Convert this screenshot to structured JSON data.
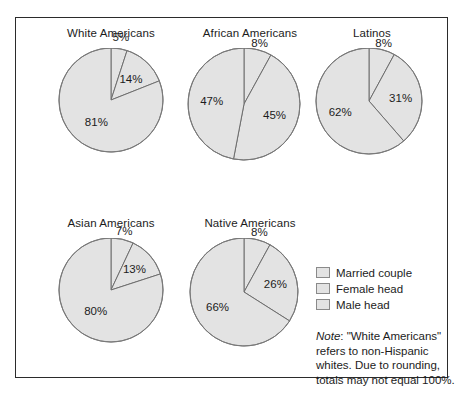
{
  "chart_data": {
    "type": "pie",
    "title": "",
    "legend_position": "right-middle",
    "legend": [
      "Married couple",
      "Female head",
      "Male head"
    ],
    "series_order": [
      "Male head",
      "Female head",
      "Married couple"
    ],
    "start_angle_deg": 0,
    "direction": "clockwise",
    "units": "percent",
    "charts": [
      {
        "title": "White Americans",
        "categories": [
          "Male head",
          "Female head",
          "Married couple"
        ],
        "values": [
          5,
          14,
          81
        ],
        "labels": [
          "5%",
          "14%",
          "81%"
        ]
      },
      {
        "title": "African Americans",
        "categories": [
          "Male head",
          "Female head",
          "Married couple"
        ],
        "values": [
          8,
          45,
          47
        ],
        "labels": [
          "8%",
          "45%",
          "47%"
        ]
      },
      {
        "title": "Latinos",
        "categories": [
          "Male head",
          "Female head",
          "Married couple"
        ],
        "values": [
          8,
          31,
          62
        ],
        "labels": [
          "8%",
          "31%",
          "62%"
        ]
      },
      {
        "title": "Asian Americans",
        "categories": [
          "Male head",
          "Female head",
          "Married couple"
        ],
        "values": [
          7,
          13,
          80
        ],
        "labels": [
          "7%",
          "13%",
          "80%"
        ]
      },
      {
        "title": "Native Americans",
        "categories": [
          "Male head",
          "Female head",
          "Married couple"
        ],
        "values": [
          8,
          26,
          66
        ],
        "labels": [
          "8%",
          "26%",
          "66%"
        ]
      }
    ],
    "note": "Note: \"White Americans\" refers to non-Hispanic whites. Due to rounding, totals may not equal 100%.",
    "colors": {
      "slice_fill": "#e3e3e3",
      "slice_stroke": "#6e6e6e",
      "frame": "#2b2b2b",
      "text": "#1c1c1c",
      "background": "#ffffff"
    }
  },
  "note": {
    "lead": "Note",
    "body": ": \"White Americans\" refers to non-Hispanic whites. Due to rounding, totals may not equal 100%."
  }
}
